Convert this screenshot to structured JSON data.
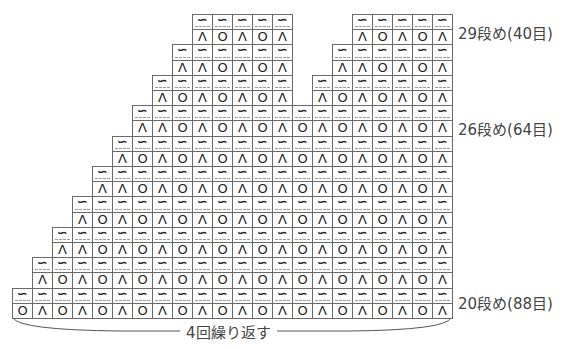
{
  "diagram": {
    "type": "knitting-chart",
    "cell_width": 20,
    "band_height": 30.4,
    "grid_top": 14,
    "grid_right": 452,
    "symbols": {
      "tilde": "∽",
      "dec": "Λ",
      "yo": "O"
    },
    "bands": [
      {
        "index": 0,
        "segments": [
          {
            "x": 192,
            "row": [
              "Λ",
              "O",
              "Λ",
              "O",
              "Λ"
            ]
          },
          {
            "x": 352,
            "row": [
              "Λ",
              "O",
              "Λ",
              "O",
              "Λ"
            ]
          }
        ]
      },
      {
        "index": 1,
        "segments": [
          {
            "x": 172,
            "row": [
              "Λ",
              "Λ",
              "O",
              "Λ",
              "O",
              "Λ"
            ]
          },
          {
            "x": 332,
            "row": [
              "Λ",
              "Λ",
              "O",
              "Λ",
              "O",
              "Λ"
            ]
          }
        ]
      },
      {
        "index": 2,
        "segments": [
          {
            "x": 152,
            "row": [
              "Λ",
              "O",
              "Λ",
              "O",
              "Λ",
              "O",
              "Λ"
            ]
          },
          {
            "x": 312,
            "row": [
              "Λ",
              "O",
              "Λ",
              "O",
              "Λ",
              "O",
              "Λ"
            ]
          }
        ]
      },
      {
        "index": 3,
        "segments": [
          {
            "x": 132,
            "row": [
              "Λ",
              "Λ",
              "O",
              "Λ",
              "O",
              "Λ",
              "O",
              "Λ",
              "O",
              "Λ",
              "O",
              "Λ",
              "O",
              "Λ",
              "O",
              "Λ"
            ]
          }
        ]
      },
      {
        "index": 4,
        "segments": [
          {
            "x": 112,
            "row": [
              "Λ",
              "O",
              "Λ",
              "O",
              "Λ",
              "O",
              "Λ",
              "O",
              "Λ",
              "O",
              "Λ",
              "O",
              "Λ",
              "O",
              "Λ",
              "O",
              "Λ"
            ]
          }
        ]
      },
      {
        "index": 5,
        "segments": [
          {
            "x": 92,
            "row": [
              "Λ",
              "Λ",
              "O",
              "Λ",
              "O",
              "Λ",
              "O",
              "Λ",
              "O",
              "Λ",
              "O",
              "Λ",
              "O",
              "Λ",
              "O",
              "Λ",
              "O",
              "Λ"
            ]
          }
        ]
      },
      {
        "index": 6,
        "segments": [
          {
            "x": 72,
            "row": [
              "Λ",
              "O",
              "Λ",
              "O",
              "Λ",
              "O",
              "Λ",
              "O",
              "Λ",
              "O",
              "Λ",
              "O",
              "Λ",
              "O",
              "Λ",
              "O",
              "Λ",
              "O",
              "Λ"
            ]
          }
        ]
      },
      {
        "index": 7,
        "segments": [
          {
            "x": 52,
            "row": [
              "Λ",
              "Λ",
              "O",
              "Λ",
              "O",
              "Λ",
              "O",
              "Λ",
              "O",
              "Λ",
              "O",
              "Λ",
              "O",
              "Λ",
              "O",
              "Λ",
              "O",
              "Λ",
              "O",
              "Λ"
            ]
          }
        ]
      },
      {
        "index": 8,
        "segments": [
          {
            "x": 32,
            "row": [
              "Λ",
              "O",
              "Λ",
              "O",
              "Λ",
              "O",
              "Λ",
              "O",
              "Λ",
              "O",
              "Λ",
              "O",
              "Λ",
              "O",
              "Λ",
              "O",
              "Λ",
              "O",
              "Λ",
              "O",
              "Λ"
            ]
          }
        ]
      },
      {
        "index": 9,
        "segments": [
          {
            "x": 12,
            "row": [
              "O",
              "Λ",
              "O",
              "Λ",
              "O",
              "Λ",
              "O",
              "Λ",
              "O",
              "Λ",
              "O",
              "Λ",
              "O",
              "Λ",
              "O",
              "Λ",
              "O",
              "Λ",
              "O",
              "Λ",
              "O",
              "Λ"
            ]
          }
        ]
      }
    ],
    "row_labels": [
      {
        "text": "29段め(40目)",
        "band": 0
      },
      {
        "text": "26段め(64目)",
        "band": 3
      },
      {
        "text": "20段め(88目)",
        "band": 9
      }
    ],
    "repeat": {
      "label": "4回繰り返す",
      "from_x": 12,
      "to_x": 452
    },
    "colors": {
      "grid_line": "#6a6a6a",
      "dashed_line": "#9a9a9a",
      "symbol": "#222222",
      "label": "#444444"
    }
  }
}
